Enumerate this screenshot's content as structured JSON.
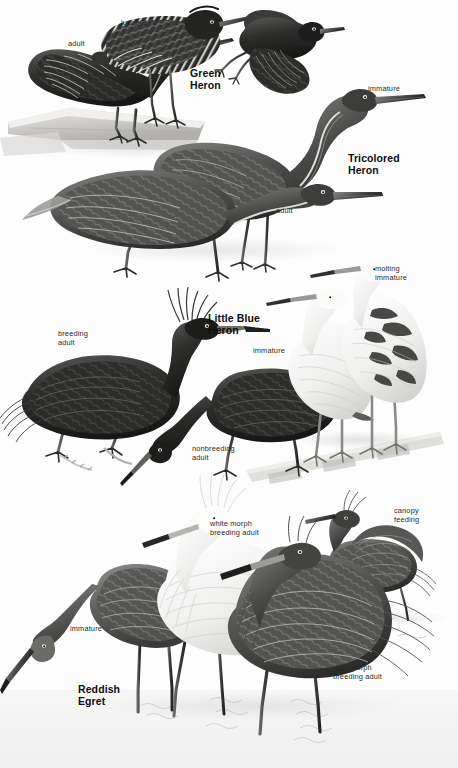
{
  "plate": {
    "kind": "field-guide-illustration-plate",
    "background_color": "#fdfdfd",
    "ink_color": "#2a2a2a",
    "page_width": 458,
    "page_height": 768
  },
  "species": [
    {
      "id": "green-heron",
      "title": "Green\nHeron",
      "title_x": 190,
      "title_y": 68,
      "figures": [
        {
          "id": "green-heron-juvenile",
          "label": "juvenile",
          "label_x": 121,
          "label_y": 18
        },
        {
          "id": "green-heron-adult-perched",
          "label": "adult",
          "label_x": 68,
          "label_y": 39
        },
        {
          "id": "green-heron-adult-flying",
          "label": "adult",
          "label_x": 296,
          "label_y": 39
        }
      ]
    },
    {
      "id": "tricolored-heron",
      "title": "Tricolored\nHeron",
      "title_x": 348,
      "title_y": 153,
      "figures": [
        {
          "id": "tricolored-heron-immature",
          "label": "immature",
          "label_x": 368,
          "label_y": 84
        },
        {
          "id": "tricolored-heron-adult",
          "label": "adult",
          "label_x": 276,
          "label_y": 206
        }
      ]
    },
    {
      "id": "little-blue-heron",
      "title": "Little Blue\nHeron",
      "title_x": 208,
      "title_y": 313,
      "figures": [
        {
          "id": "little-blue-heron-breeding-adult",
          "label": "breeding\nadult",
          "label_x": 58,
          "label_y": 329
        },
        {
          "id": "little-blue-heron-nonbreeding-adult",
          "label": "nonbreeding\nadult",
          "label_x": 192,
          "label_y": 444
        },
        {
          "id": "little-blue-heron-immature",
          "label": "immature",
          "label_x": 253,
          "label_y": 346
        },
        {
          "id": "little-blue-heron-molting-immature",
          "label": "molting\nimmature",
          "label_x": 375,
          "label_y": 264
        }
      ]
    },
    {
      "id": "reddish-egret",
      "title": "Reddish\nEgret",
      "title_x": 78,
      "title_y": 684,
      "figures": [
        {
          "id": "reddish-egret-white-morph",
          "label": "white morph\nbreeding adult",
          "label_x": 210,
          "label_y": 519
        },
        {
          "id": "reddish-egret-dark-morph",
          "label": "dark morph\nbreeding adult",
          "label_x": 333,
          "label_y": 663
        },
        {
          "id": "reddish-egret-immature",
          "label": "immature",
          "label_x": 70,
          "label_y": 624
        },
        {
          "id": "reddish-egret-canopy-feeding",
          "label": "canopy\nfeeding",
          "label_x": 394,
          "label_y": 506
        }
      ]
    }
  ]
}
